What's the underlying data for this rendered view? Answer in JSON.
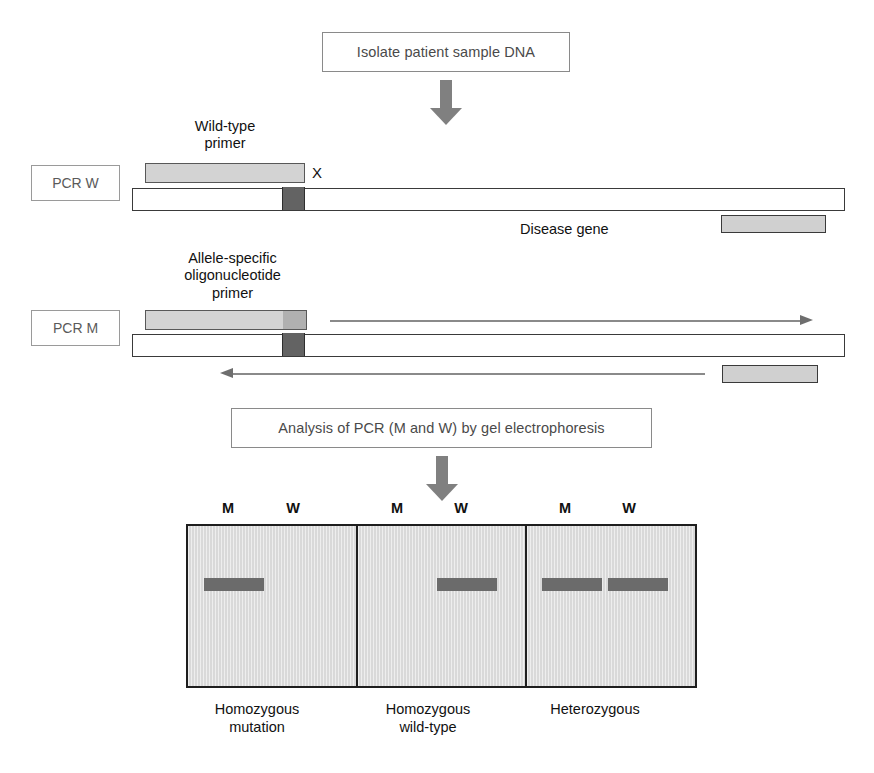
{
  "steps": {
    "isolate": "Isolate patient sample DNA",
    "analysis": "Analysis of PCR (M and W) by gel electrophoresis"
  },
  "reactions": {
    "pcr_w": {
      "tag": "PCR W",
      "primer_caption": "Wild-type\nprimer",
      "mutation_marker": "X",
      "gene_label": "Disease gene"
    },
    "pcr_m": {
      "tag": "PCR M",
      "primer_caption": "Allele-specific\noligonucleotide\nprimer"
    }
  },
  "gel": {
    "lane_labels": [
      "M",
      "W",
      "M",
      "W",
      "M",
      "W"
    ],
    "panels": [
      {
        "genotype": "Homozygous\nmutation",
        "bands": {
          "M": true,
          "W": false
        }
      },
      {
        "genotype": "Homozygous\nwild-type",
        "bands": {
          "M": false,
          "W": true
        }
      },
      {
        "genotype": "Heterozygous",
        "bands": {
          "M": true,
          "W": true
        }
      }
    ]
  },
  "colors": {
    "primer_fill": "#d3d3d3",
    "primer_tip": "#b0b0b0",
    "mutation_site": "#636363",
    "gene_box": "#d0d0d0",
    "gel_background": "#d9d9d9",
    "band": "#6b6b6b",
    "arrow_gray": "#808080",
    "outline": "#3a3a3a"
  }
}
